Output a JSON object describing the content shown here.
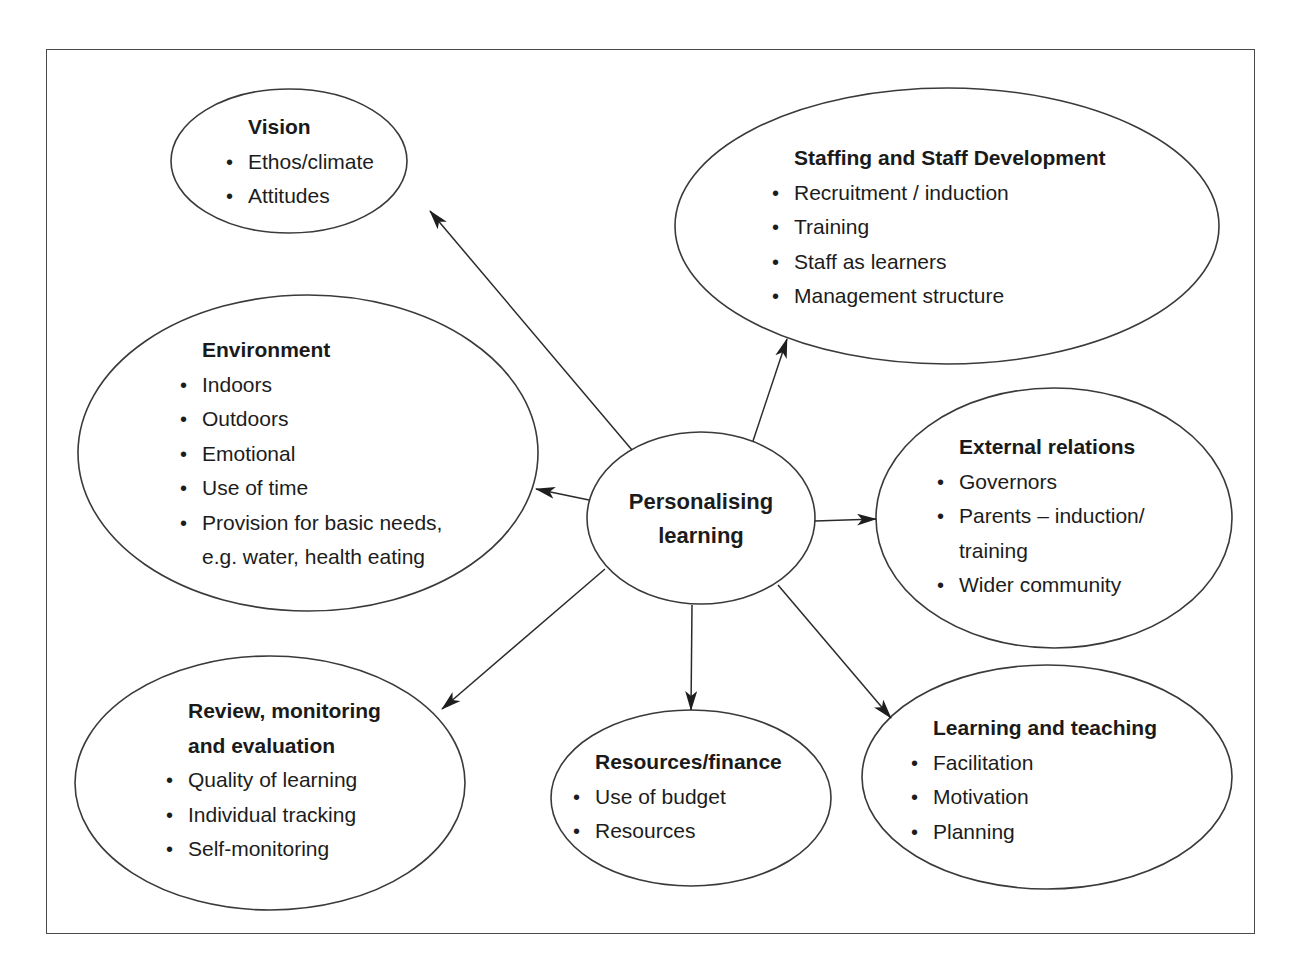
{
  "diagram": {
    "type": "mind-map",
    "center": {
      "title_line1": "Personalising",
      "title_line2": "learning"
    },
    "nodes": {
      "vision": {
        "title": "Vision",
        "items": [
          "Ethos/climate",
          "Attitudes"
        ]
      },
      "staffing": {
        "title": "Staffing and Staff Development",
        "items": [
          "Recruitment / induction",
          "Training",
          "Staff as learners",
          "Management structure"
        ]
      },
      "environment": {
        "title": "Environment",
        "items": [
          "Indoors",
          "Outdoors",
          "Emotional",
          "Use of time",
          "Provision for basic needs,",
          "e.g. water, health eating"
        ]
      },
      "external": {
        "title": "External relations",
        "items": [
          "Governors",
          "Parents – induction/",
          "training",
          "Wider community"
        ]
      },
      "review": {
        "title_line1": "Review, monitoring",
        "title_line2": "and evaluation",
        "items": [
          "Quality of learning",
          "Individual tracking",
          "Self-monitoring"
        ]
      },
      "resources": {
        "title": "Resources/finance",
        "items": [
          "Use of budget",
          "Resources"
        ]
      },
      "learning": {
        "title": "Learning and teaching",
        "items": [
          "Facilitation",
          "Motivation",
          "Planning"
        ]
      }
    },
    "edges": [
      {
        "from": "center",
        "to": "vision"
      },
      {
        "from": "center",
        "to": "staffing"
      },
      {
        "from": "center",
        "to": "environment"
      },
      {
        "from": "center",
        "to": "external"
      },
      {
        "from": "center",
        "to": "review"
      },
      {
        "from": "center",
        "to": "resources"
      },
      {
        "from": "center",
        "to": "learning"
      }
    ],
    "colors": {
      "stroke": "#3a3a3a",
      "text": "#1c1c1c",
      "background": "#ffffff"
    }
  }
}
